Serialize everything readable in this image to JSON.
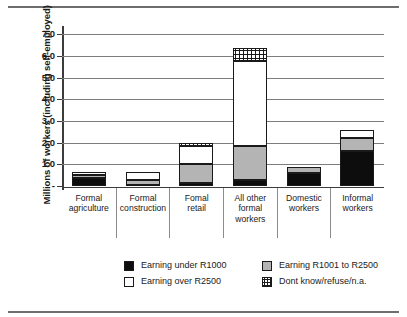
{
  "chart_data": {
    "type": "bar",
    "stacked": true,
    "title": "",
    "subtitle": "",
    "xlabel": "",
    "ylabel": "Millions of workers (including self-employed)",
    "ylim": [
      0,
      7.2
    ],
    "ytick_values": [
      0,
      1.0,
      2.0,
      3.0,
      4.0,
      5.0,
      6.0,
      7.0
    ],
    "ytick_labels": [
      "-",
      "1.0",
      "2.0",
      "3.0",
      "4.0",
      "5.0",
      "6.0",
      "7.0"
    ],
    "grid": "horizontal",
    "legend_position": "bottom",
    "categories": [
      "Formal\nagriculture",
      "Formal\nconstruction",
      "Fomal\nretail",
      "All other\nformal\nworkers",
      "Domestic\nworkers",
      "Informal\nworkers"
    ],
    "series": [
      {
        "name": "Earning under R1000",
        "color": "#0d0d0d",
        "pattern": "solid-black",
        "values": [
          0.35,
          0.03,
          0.15,
          0.3,
          0.6,
          1.6
        ]
      },
      {
        "name": "Earning R1001 to R2500",
        "color": "#b4b4b4",
        "pattern": "solid-gray",
        "values": [
          0.15,
          0.27,
          0.85,
          1.55,
          0.3,
          0.6
        ]
      },
      {
        "name": "Earning over R2500",
        "color": "#ffffff",
        "pattern": "solid-white",
        "values": [
          0.15,
          0.35,
          0.85,
          3.9,
          0.0,
          0.4
        ]
      },
      {
        "name": "Dont know/refuse/n.a.",
        "color": "#ffffff",
        "pattern": "checkered",
        "values": [
          0.0,
          0.0,
          0.15,
          0.6,
          0.0,
          0.0
        ]
      }
    ],
    "totals": [
      0.65,
      0.65,
      2.0,
      6.35,
      0.9,
      2.6
    ]
  },
  "legend": {
    "items": [
      {
        "label": "Earning under R1000",
        "swatch": "s-black"
      },
      {
        "label": "Earning R1001 to R2500",
        "swatch": "s-gray"
      },
      {
        "label": "Earning over R2500",
        "swatch": "s-white"
      },
      {
        "label": "Dont know/refuse/n.a.",
        "swatch": "s-check"
      }
    ]
  }
}
